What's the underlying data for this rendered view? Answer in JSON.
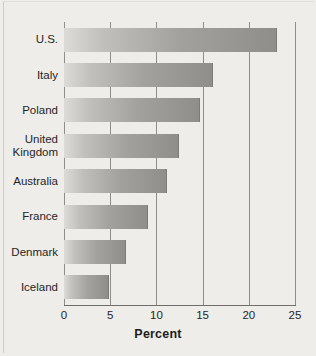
{
  "chart": {
    "xlabel": "Percent",
    "tick_labels": [
      "0",
      "5",
      "10",
      "15",
      "20",
      "25"
    ],
    "bar_color_light": "#dddbd7",
    "bar_color_dark": "#908e8a",
    "background": "#eeedea"
  },
  "chart_data": {
    "type": "bar",
    "orientation": "horizontal",
    "title": "",
    "subtitle": "",
    "xlabel": "Percent",
    "ylabel": "",
    "categories": [
      "U.S.",
      "Italy",
      "Poland",
      "United\nKingdom",
      "Australia",
      "France",
      "Denmark",
      "Iceland"
    ],
    "values": [
      23.1,
      16.1,
      14.7,
      12.4,
      11.1,
      9.1,
      6.7,
      4.9
    ],
    "xlim": [
      0,
      25
    ],
    "xticks": [
      0,
      5,
      10,
      15,
      20,
      25
    ],
    "grid": "vertical",
    "legend": "none"
  }
}
